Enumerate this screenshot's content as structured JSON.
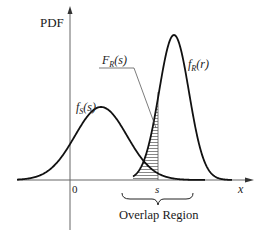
{
  "diagram": {
    "y_axis_label": "PDF",
    "x_axis_label": "x",
    "origin_label": "0",
    "s_marker_label": "s",
    "region_label": "Overlap Region",
    "curves": [
      {
        "id": "stress",
        "label_main": "f",
        "label_sub": "S",
        "label_arg": "(s)"
      },
      {
        "id": "strength",
        "label_main": "f",
        "label_sub": "R",
        "label_arg": "(r)"
      }
    ],
    "hatched_area": {
      "label_main": "F",
      "label_sub": "R",
      "label_arg": "(s)"
    },
    "colors": {
      "curve": "#111111",
      "axis": "#555555",
      "hatch": "#444444",
      "text": "#1a1a1a"
    }
  }
}
